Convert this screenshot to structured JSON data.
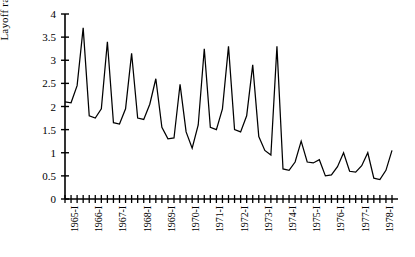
{
  "chart_data": {
    "type": "line",
    "title": "",
    "xlabel": "",
    "ylabel": "Layoff rate",
    "ylim": [
      0,
      4
    ],
    "yticks": [
      0,
      0.5,
      1,
      1.5,
      2,
      2.5,
      3,
      3.5,
      4
    ],
    "ytick_labels": [
      "0",
      "0.5",
      "1",
      "1.5",
      "2",
      "2.5",
      "3",
      "3.5",
      "4"
    ],
    "grid": false,
    "legend": null,
    "x_tick_labels": [
      "1965-I",
      "1966-I",
      "1967-I",
      "1968-I",
      "1969-I",
      "1970-I",
      "1971-I",
      "1972-I",
      "1973-I",
      "1974-I",
      "1975-I",
      "1976-I",
      "1977-I",
      "1978-I"
    ],
    "x_tick_interval": "quarterly",
    "x": [
      "1965-I",
      "1965-II",
      "1965-III",
      "1965-IV",
      "1966-I",
      "1966-II",
      "1966-III",
      "1966-IV",
      "1967-I",
      "1967-II",
      "1967-III",
      "1967-IV",
      "1968-I",
      "1968-II",
      "1968-III",
      "1968-IV",
      "1969-I",
      "1969-II",
      "1969-III",
      "1969-IV",
      "1970-I",
      "1970-II",
      "1970-III",
      "1970-IV",
      "1971-I",
      "1971-II",
      "1971-III",
      "1971-IV",
      "1972-I",
      "1972-II",
      "1972-III",
      "1972-IV",
      "1973-I",
      "1973-II",
      "1973-III",
      "1973-IV",
      "1974-I",
      "1974-II",
      "1974-III",
      "1974-IV",
      "1975-I",
      "1975-II",
      "1975-III",
      "1975-IV",
      "1976-I",
      "1976-II",
      "1976-III",
      "1976-IV",
      "1977-I",
      "1977-II",
      "1977-III",
      "1977-IV",
      "1978-I",
      "1978-II",
      "1978-III"
    ],
    "values": [
      2.1,
      2.08,
      2.45,
      3.7,
      1.8,
      1.75,
      1.95,
      3.4,
      1.65,
      1.62,
      1.95,
      3.15,
      1.75,
      1.72,
      2.05,
      2.6,
      1.55,
      1.3,
      1.32,
      2.48,
      1.45,
      1.1,
      1.6,
      3.25,
      1.55,
      1.5,
      1.95,
      3.3,
      1.5,
      1.45,
      1.8,
      2.9,
      1.35,
      1.05,
      0.95,
      3.3,
      0.65,
      0.62,
      0.8,
      1.25,
      0.8,
      0.78,
      0.85,
      0.5,
      0.52,
      0.7,
      1.0,
      0.6,
      0.58,
      0.72,
      1.0,
      0.45,
      0.42,
      0.62,
      1.05
    ],
    "series_color": "#000000",
    "axis_color": "#000000"
  }
}
